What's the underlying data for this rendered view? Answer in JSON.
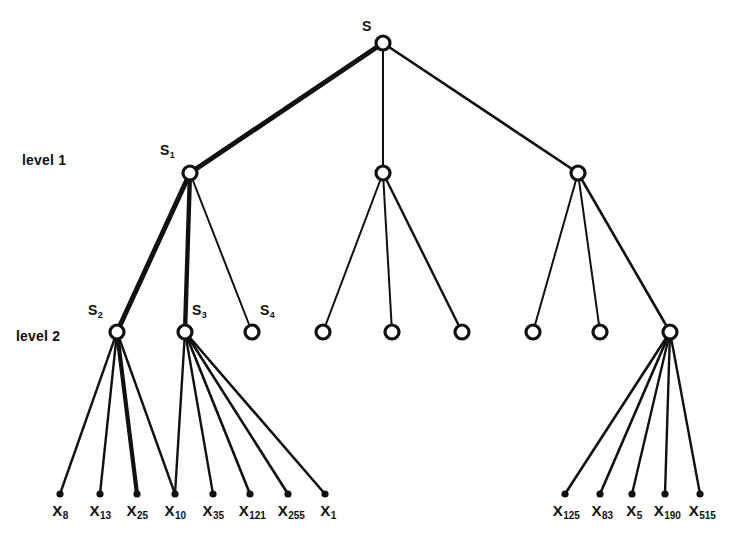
{
  "figure": {
    "type": "tree-diagram",
    "background": "#ffffff",
    "stroke_color": "#111111",
    "width": 750,
    "height": 537
  },
  "level_labels": [
    {
      "name": "level-1-label",
      "text": "level 1",
      "x": 22,
      "y": 152
    },
    {
      "name": "level-2-label",
      "text": "level 2",
      "x": 16,
      "y": 328
    }
  ],
  "nodes": {
    "root": {
      "id": "S",
      "label": "S",
      "sub": "",
      "x": 383,
      "y": 43,
      "r": 7,
      "label_x": 362,
      "label_y": 18
    },
    "level1": [
      {
        "id": "S1",
        "label": "S",
        "sub": "1",
        "x": 190,
        "y": 173,
        "r": 7,
        "label_x": 160,
        "label_y": 142
      },
      {
        "id": "L1b",
        "label": "",
        "sub": "",
        "x": 383,
        "y": 173,
        "r": 7
      },
      {
        "id": "L1c",
        "label": "",
        "sub": "",
        "x": 578,
        "y": 173,
        "r": 7
      }
    ],
    "level2": [
      {
        "id": "S2",
        "label": "S",
        "sub": "2",
        "x": 117,
        "y": 332,
        "r": 7,
        "label_x": 88,
        "label_y": 302
      },
      {
        "id": "S3",
        "label": "S",
        "sub": "3",
        "x": 185,
        "y": 332,
        "r": 7,
        "label_x": 192,
        "label_y": 302
      },
      {
        "id": "S4",
        "label": "S",
        "sub": "4",
        "x": 252,
        "y": 332,
        "r": 7,
        "label_x": 260,
        "label_y": 302
      },
      {
        "id": "M1",
        "label": "",
        "sub": "",
        "x": 323,
        "y": 332,
        "r": 7
      },
      {
        "id": "M2",
        "label": "",
        "sub": "",
        "x": 392,
        "y": 332,
        "r": 7
      },
      {
        "id": "M3",
        "label": "",
        "sub": "",
        "x": 462,
        "y": 332,
        "r": 7
      },
      {
        "id": "R1",
        "label": "",
        "sub": "",
        "x": 533,
        "y": 332,
        "r": 7
      },
      {
        "id": "R2",
        "label": "",
        "sub": "",
        "x": 600,
        "y": 332,
        "r": 7
      },
      {
        "id": "R3",
        "label": "",
        "sub": "",
        "x": 670,
        "y": 332,
        "r": 7
      }
    ],
    "leaves": [
      {
        "id": "X8",
        "label": "X",
        "sub": "8",
        "x": 60,
        "y": 494,
        "label_x": 60,
        "label_y": 502
      },
      {
        "id": "X13",
        "label": "X",
        "sub": "13",
        "x": 100,
        "y": 494,
        "label_x": 100,
        "label_y": 502
      },
      {
        "id": "X25",
        "label": "X",
        "sub": "25",
        "x": 137,
        "y": 494,
        "label_x": 137,
        "label_y": 502
      },
      {
        "id": "X10",
        "label": "X",
        "sub": "10",
        "x": 175,
        "y": 494,
        "label_x": 175,
        "label_y": 502
      },
      {
        "id": "X35",
        "label": "X",
        "sub": "35",
        "x": 213,
        "y": 494,
        "label_x": 213,
        "label_y": 502
      },
      {
        "id": "X121",
        "label": "X",
        "sub": "121",
        "x": 250,
        "y": 494,
        "label_x": 252,
        "label_y": 502
      },
      {
        "id": "X255",
        "label": "X",
        "sub": "255",
        "x": 288,
        "y": 494,
        "label_x": 291,
        "label_y": 502
      },
      {
        "id": "X1",
        "label": "X",
        "sub": "1",
        "x": 325,
        "y": 494,
        "label_x": 328,
        "label_y": 502
      },
      {
        "id": "X125",
        "label": "X",
        "sub": "125",
        "x": 565,
        "y": 494,
        "label_x": 566,
        "label_y": 502
      },
      {
        "id": "X83",
        "label": "X",
        "sub": "83",
        "x": 600,
        "y": 494,
        "label_x": 602,
        "label_y": 502
      },
      {
        "id": "X5",
        "label": "X",
        "sub": "5",
        "x": 632,
        "y": 494,
        "label_x": 634,
        "label_y": 502
      },
      {
        "id": "X190",
        "label": "X",
        "sub": "190",
        "x": 665,
        "y": 494,
        "label_x": 667,
        "label_y": 502
      },
      {
        "id": "X515",
        "label": "X",
        "sub": "515",
        "x": 700,
        "y": 494,
        "label_x": 702,
        "label_y": 502
      }
    ]
  },
  "edges": [
    {
      "from": "S",
      "to": "S1",
      "x1": 383,
      "y1": 43,
      "x2": 190,
      "y2": 173,
      "w": 5
    },
    {
      "from": "S",
      "to": "L1b",
      "x1": 383,
      "y1": 43,
      "x2": 383,
      "y2": 173,
      "w": 2
    },
    {
      "from": "S",
      "to": "L1c",
      "x1": 383,
      "y1": 43,
      "x2": 578,
      "y2": 173,
      "w": 2.6
    },
    {
      "from": "S1",
      "to": "S2",
      "x1": 190,
      "y1": 173,
      "x2": 117,
      "y2": 332,
      "w": 5
    },
    {
      "from": "S1",
      "to": "S3",
      "x1": 190,
      "y1": 173,
      "x2": 185,
      "y2": 332,
      "w": 4.4
    },
    {
      "from": "S1",
      "to": "S4",
      "x1": 190,
      "y1": 173,
      "x2": 252,
      "y2": 332,
      "w": 2
    },
    {
      "from": "L1b",
      "to": "M1",
      "x1": 383,
      "y1": 173,
      "x2": 323,
      "y2": 332,
      "w": 2
    },
    {
      "from": "L1b",
      "to": "M2",
      "x1": 383,
      "y1": 173,
      "x2": 392,
      "y2": 332,
      "w": 2
    },
    {
      "from": "L1b",
      "to": "M3",
      "x1": 383,
      "y1": 173,
      "x2": 462,
      "y2": 332,
      "w": 2.4
    },
    {
      "from": "L1c",
      "to": "R1",
      "x1": 578,
      "y1": 173,
      "x2": 533,
      "y2": 332,
      "w": 2
    },
    {
      "from": "L1c",
      "to": "R2",
      "x1": 578,
      "y1": 173,
      "x2": 600,
      "y2": 332,
      "w": 2
    },
    {
      "from": "L1c",
      "to": "R3",
      "x1": 578,
      "y1": 173,
      "x2": 670,
      "y2": 332,
      "w": 2.6
    },
    {
      "from": "S2",
      "to": "X8",
      "x1": 117,
      "y1": 332,
      "x2": 60,
      "y2": 494,
      "w": 2.4
    },
    {
      "from": "S2",
      "to": "X13",
      "x1": 117,
      "y1": 332,
      "x2": 100,
      "y2": 494,
      "w": 2.4
    },
    {
      "from": "S2",
      "to": "X25",
      "x1": 117,
      "y1": 332,
      "x2": 137,
      "y2": 494,
      "w": 4.2
    },
    {
      "from": "S2",
      "to": "X10",
      "x1": 117,
      "y1": 332,
      "x2": 175,
      "y2": 494,
      "w": 2.4
    },
    {
      "from": "S3",
      "to": "X10b",
      "x1": 185,
      "y1": 332,
      "x2": 175,
      "y2": 494,
      "w": 2.4
    },
    {
      "from": "S3",
      "to": "X35",
      "x1": 185,
      "y1": 332,
      "x2": 213,
      "y2": 494,
      "w": 2.4
    },
    {
      "from": "S3",
      "to": "X121",
      "x1": 185,
      "y1": 332,
      "x2": 250,
      "y2": 494,
      "w": 2.6
    },
    {
      "from": "S3",
      "to": "X255",
      "x1": 185,
      "y1": 332,
      "x2": 288,
      "y2": 494,
      "w": 2.6
    },
    {
      "from": "S3",
      "to": "X1",
      "x1": 185,
      "y1": 332,
      "x2": 325,
      "y2": 494,
      "w": 2.6
    },
    {
      "from": "R3",
      "to": "X125",
      "x1": 670,
      "y1": 332,
      "x2": 565,
      "y2": 494,
      "w": 2.6
    },
    {
      "from": "R3",
      "to": "X83",
      "x1": 670,
      "y1": 332,
      "x2": 600,
      "y2": 494,
      "w": 2.6
    },
    {
      "from": "R3",
      "to": "X5",
      "x1": 670,
      "y1": 332,
      "x2": 632,
      "y2": 494,
      "w": 2.4
    },
    {
      "from": "R3",
      "to": "X190",
      "x1": 670,
      "y1": 332,
      "x2": 665,
      "y2": 494,
      "w": 2.4
    },
    {
      "from": "R3",
      "to": "X515",
      "x1": 670,
      "y1": 332,
      "x2": 700,
      "y2": 494,
      "w": 2.4
    }
  ]
}
